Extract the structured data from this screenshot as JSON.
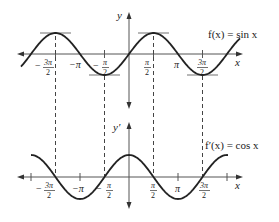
{
  "diagram": {
    "top_plot": {
      "function_label": "f(x) = sin x",
      "y_axis_label": "y",
      "x_axis_label": "x",
      "tick_labels": [
        {
          "label_num": "3π",
          "label_den": "2",
          "sign": "−",
          "value": "-3pi/2"
        },
        {
          "label": "−π",
          "value": "-pi"
        },
        {
          "label_num": "π",
          "label_den": "2",
          "sign": "−",
          "value": "-pi/2"
        },
        {
          "label_num": "π",
          "label_den": "2",
          "sign": "",
          "value": "pi/2"
        },
        {
          "label": "π",
          "value": "pi"
        },
        {
          "label_num": "3π",
          "label_den": "2",
          "sign": "",
          "value": "3pi/2"
        }
      ],
      "horizontal_tangents_at": [
        "-3pi/2",
        "-pi/2",
        "pi/2",
        "3pi/2"
      ]
    },
    "bottom_plot": {
      "function_label": "f′(x) = cos x",
      "y_axis_label": "y′",
      "x_axis_label": "x",
      "tick_labels": [
        {
          "label_num": "3π",
          "label_den": "2",
          "sign": "−",
          "value": "-3pi/2"
        },
        {
          "label": "−π",
          "value": "-pi"
        },
        {
          "label_num": "π",
          "label_den": "2",
          "sign": "−",
          "value": "-pi/2"
        },
        {
          "label_num": "π",
          "label_den": "2",
          "sign": "",
          "value": "pi/2"
        },
        {
          "label": "π",
          "value": "pi"
        },
        {
          "label_num": "3π",
          "label_den": "2",
          "sign": "",
          "value": "3pi/2"
        }
      ]
    },
    "dashed_guides_at": [
      "-3pi/2",
      "-pi/2",
      "pi/2",
      "3pi/2"
    ],
    "colors": {
      "curve": "#222222",
      "axis": "#555555",
      "tangent": "#888888",
      "dashed": "#444444",
      "background": "#ffffff"
    }
  }
}
